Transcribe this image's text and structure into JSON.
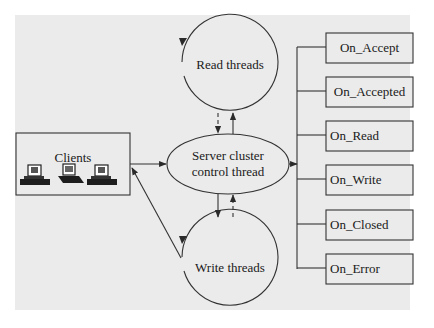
{
  "diagram": {
    "background_color": "#ebebeb",
    "stroke_color": "#333333",
    "nodes": {
      "clients": {
        "label": "Clients",
        "icons": [
          "desktop-computer",
          "laptop-computer",
          "desktop-computer"
        ]
      },
      "read_threads": {
        "label": "Read threads",
        "shape": "circle"
      },
      "write_threads": {
        "label": "Write threads",
        "shape": "circle"
      },
      "server": {
        "line1": "Server cluster",
        "line2": "control thread",
        "shape": "ellipse"
      }
    },
    "events": [
      {
        "label": "On_Accept"
      },
      {
        "label": "On_Accepted"
      },
      {
        "label": "On_Read"
      },
      {
        "label": "On_Write"
      },
      {
        "label": "On_Closed"
      },
      {
        "label": "On_Error"
      }
    ],
    "edges": [
      {
        "from": "clients",
        "to": "server",
        "style": "solid"
      },
      {
        "from": "write_threads",
        "to": "clients",
        "style": "solid"
      },
      {
        "from": "read_threads",
        "to": "server",
        "style": "dashed"
      },
      {
        "from": "server",
        "to": "read_threads",
        "style": "solid"
      },
      {
        "from": "server",
        "to": "write_threads",
        "style": "solid"
      },
      {
        "from": "write_threads",
        "to": "server",
        "style": "dashed"
      },
      {
        "from": "server",
        "to": "events",
        "style": "solid"
      },
      {
        "from": "read_threads",
        "to": "read_threads",
        "style": "loop"
      },
      {
        "from": "write_threads",
        "to": "write_threads",
        "style": "loop"
      }
    ]
  }
}
